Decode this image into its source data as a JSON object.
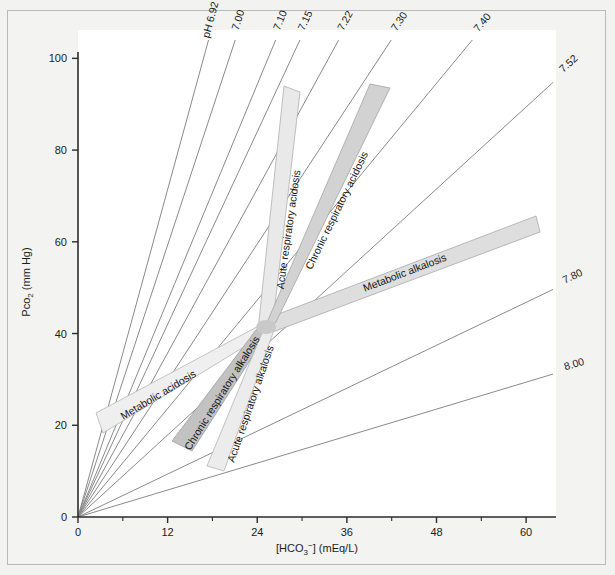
{
  "figure": {
    "width": 615,
    "height": 575,
    "background": "#f2f2f0",
    "plot_background": "#ffffff",
    "frame_color": "#b9b9b6"
  },
  "chart_data": {
    "type": "line",
    "title": "",
    "xlabel": "[HCO3-] (mEq/L)",
    "ylabel": "Pco2 (mm Hg)",
    "xlim": [
      0,
      64
    ],
    "ylim": [
      0,
      104
    ],
    "xticks": [
      0,
      12,
      24,
      36,
      48,
      60
    ],
    "xtick_labels": [
      "0",
      "12",
      "24",
      "36",
      "48",
      "60"
    ],
    "xminorticks": [
      6,
      18,
      30,
      42,
      54
    ],
    "yticks": [
      0,
      20,
      40,
      60,
      80,
      100
    ],
    "ytick_labels": [
      "0",
      "20",
      "40",
      "60",
      "80",
      "100"
    ],
    "grid": false,
    "legend": "none",
    "normal_point": {
      "hco3": 24,
      "pco2": 40
    },
    "iso_ph_lines": [
      {
        "label": "pH 6.92",
        "ph": 6.92,
        "slope_pco2_per_hco3": 5.95,
        "label_prefix": "pH"
      },
      {
        "label": "7.00",
        "ph": 7.0,
        "slope_pco2_per_hco3": 4.94
      },
      {
        "label": "7.10",
        "ph": 7.1,
        "slope_pco2_per_hco3": 3.93
      },
      {
        "label": "7.15",
        "ph": 7.15,
        "slope_pco2_per_hco3": 3.5
      },
      {
        "label": "7.22",
        "ph": 7.22,
        "slope_pco2_per_hco3": 2.98
      },
      {
        "label": "7.30",
        "ph": 7.3,
        "slope_pco2_per_hco3": 2.48
      },
      {
        "label": "7.40",
        "ph": 7.4,
        "slope_pco2_per_hco3": 1.97
      },
      {
        "label": "7.52",
        "ph": 7.52,
        "slope_pco2_per_hco3": 1.49
      },
      {
        "label": "7.80",
        "ph": 7.8,
        "slope_pco2_per_hco3": 0.78
      },
      {
        "label": "8.00",
        "ph": 8.0,
        "slope_pco2_per_hco3": 0.49
      }
    ],
    "bands": [
      {
        "name": "Acute respiratory acidosis",
        "shade": "#e4e4e4"
      },
      {
        "name": "Chronic respiratory acidosis",
        "shade": "#cfcfcf"
      },
      {
        "name": "Metabolic alkalosis",
        "shade": "#dcdcdc"
      },
      {
        "name": "Metabolic acidosis",
        "shade": "#ececec"
      },
      {
        "name": "Chronic respiratory alkalosis",
        "shade": "#bdbdbd"
      },
      {
        "name": "Acute respiratory alkalosis",
        "shade": "#e8e8e8"
      }
    ]
  },
  "axes": {
    "x": {
      "title_main": "[HCO",
      "title_sub": "3",
      "title_sup": "−",
      "title_tail": "] (mEq/L)",
      "ticks": [
        "0",
        "12",
        "24",
        "36",
        "48",
        "60"
      ]
    },
    "y": {
      "title_main": "Pco",
      "title_sub": "2",
      "title_tail": " (mm Hg)",
      "ticks": [
        "0",
        "20",
        "40",
        "60",
        "80",
        "100"
      ]
    }
  },
  "ph_labels": {
    "prefix": "pH",
    "values": [
      "6.92",
      "7.00",
      "7.10",
      "7.15",
      "7.22",
      "7.30",
      "7.40",
      "7.52",
      "7.80",
      "8.00"
    ]
  },
  "band_labels": {
    "acute_respiratory_acidosis": "Acute respiratory acidosis",
    "chronic_respiratory_acidosis": "Chronic respiratory acidosis",
    "metabolic_alkalosis": "Metabolic alkalosis",
    "metabolic_acidosis": "Metabolic acidosis",
    "chronic_respiratory_alkalosis": "Chronic respiratory alkalosis",
    "acute_respiratory_alkalosis": "Acute respiratory alkalosis"
  },
  "colors": {
    "line": "#8a8a8a",
    "axis": "#2b2b2b",
    "text": "#1b1b1b",
    "band_stroke": "#a9a9a9"
  }
}
